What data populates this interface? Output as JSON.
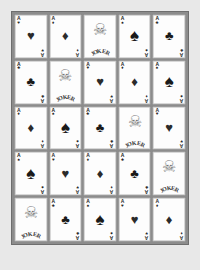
{
  "board": {
    "name": "playing-card-grid",
    "rows": 5,
    "columns": 5,
    "background_color": "#e8e8e8",
    "frame_color": "#8c8c8c",
    "card_color": "#fdfdfd"
  },
  "glyphs": {
    "hearts": "♥",
    "diamonds": "♦",
    "clubs": "♣",
    "spades": "♠",
    "joker_face": "☠"
  },
  "joker": {
    "label": "JOKER",
    "letters": [
      "J",
      "O",
      "K",
      "E",
      "R"
    ]
  },
  "rank": "A",
  "cards": [
    [
      {
        "type": "ace",
        "suit": "hearts",
        "rank": "A",
        "glyph": "♥",
        "color": "red",
        "name": "ace-of-hearts"
      },
      {
        "type": "ace",
        "suit": "diamonds",
        "rank": "A",
        "glyph": "♦",
        "color": "red",
        "name": "ace-of-diamonds"
      },
      {
        "type": "joker",
        "suit": "joker",
        "rank": "",
        "glyph": "☠",
        "color": "black",
        "name": "joker-card"
      },
      {
        "type": "ace",
        "suit": "spades",
        "rank": "A",
        "glyph": "♠",
        "color": "black",
        "name": "ace-of-spades"
      },
      {
        "type": "ace",
        "suit": "clubs",
        "rank": "A",
        "glyph": "♣",
        "color": "black",
        "name": "ace-of-clubs"
      }
    ],
    [
      {
        "type": "ace",
        "suit": "clubs",
        "rank": "A",
        "glyph": "♣",
        "color": "black",
        "name": "ace-of-clubs"
      },
      {
        "type": "joker",
        "suit": "joker",
        "rank": "",
        "glyph": "☠",
        "color": "black",
        "name": "joker-card"
      },
      {
        "type": "ace",
        "suit": "hearts",
        "rank": "A",
        "glyph": "♥",
        "color": "red",
        "name": "ace-of-hearts"
      },
      {
        "type": "ace",
        "suit": "diamonds",
        "rank": "A",
        "glyph": "♦",
        "color": "red",
        "name": "ace-of-diamonds"
      },
      {
        "type": "ace",
        "suit": "spades",
        "rank": "A",
        "glyph": "♠",
        "color": "black",
        "name": "ace-of-spades"
      }
    ],
    [
      {
        "type": "ace",
        "suit": "diamonds",
        "rank": "A",
        "glyph": "♦",
        "color": "red",
        "name": "ace-of-diamonds"
      },
      {
        "type": "ace",
        "suit": "spades",
        "rank": "A",
        "glyph": "♠",
        "color": "black",
        "name": "ace-of-spades"
      },
      {
        "type": "ace",
        "suit": "clubs",
        "rank": "A",
        "glyph": "♣",
        "color": "black",
        "name": "ace-of-clubs"
      },
      {
        "type": "joker",
        "suit": "joker",
        "rank": "",
        "glyph": "☠",
        "color": "black",
        "name": "joker-card"
      },
      {
        "type": "ace",
        "suit": "hearts",
        "rank": "A",
        "glyph": "♥",
        "color": "red",
        "name": "ace-of-hearts"
      }
    ],
    [
      {
        "type": "ace",
        "suit": "spades",
        "rank": "A",
        "glyph": "♠",
        "color": "black",
        "name": "ace-of-spades"
      },
      {
        "type": "ace",
        "suit": "hearts",
        "rank": "A",
        "glyph": "♥",
        "color": "red",
        "name": "ace-of-hearts"
      },
      {
        "type": "ace",
        "suit": "diamonds",
        "rank": "A",
        "glyph": "♦",
        "color": "red",
        "name": "ace-of-diamonds"
      },
      {
        "type": "ace",
        "suit": "clubs",
        "rank": "A",
        "glyph": "♣",
        "color": "black",
        "name": "ace-of-clubs"
      },
      {
        "type": "joker",
        "suit": "joker",
        "rank": "",
        "glyph": "☠",
        "color": "black",
        "name": "joker-card"
      }
    ],
    [
      {
        "type": "joker",
        "suit": "joker",
        "rank": "",
        "glyph": "☠",
        "color": "black",
        "name": "joker-card"
      },
      {
        "type": "ace",
        "suit": "clubs",
        "rank": "A",
        "glyph": "♣",
        "color": "black",
        "name": "ace-of-clubs"
      },
      {
        "type": "ace",
        "suit": "spades",
        "rank": "A",
        "glyph": "♠",
        "color": "black",
        "name": "ace-of-spades"
      },
      {
        "type": "ace",
        "suit": "hearts",
        "rank": "A",
        "glyph": "♥",
        "color": "red",
        "name": "ace-of-hearts"
      },
      {
        "type": "ace",
        "suit": "diamonds",
        "rank": "A",
        "glyph": "♦",
        "color": "red",
        "name": "ace-of-diamonds"
      }
    ]
  ]
}
